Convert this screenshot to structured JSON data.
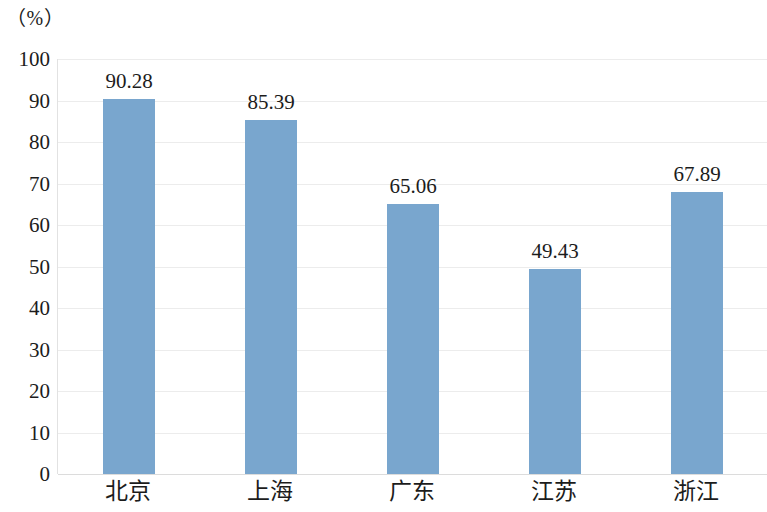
{
  "chart_data": {
    "type": "bar",
    "title": "",
    "subtitle": "",
    "xlabel": "",
    "ylabel": "（%）",
    "unit_label": "（%）",
    "categories": [
      "北京",
      "上海",
      "广东",
      "江苏",
      "浙江"
    ],
    "values": [
      90.28,
      85.39,
      65.06,
      49.43,
      67.89
    ],
    "value_labels": [
      "90.28",
      "85.39",
      "65.06",
      "49.43",
      "67.89"
    ],
    "series": [
      {
        "name": "",
        "values": [
          90.28,
          85.39,
          65.06,
          49.43,
          67.89
        ],
        "color": "#79a6ce"
      }
    ],
    "ylim": [
      0,
      100
    ],
    "ytick_values": [
      0,
      10,
      20,
      30,
      40,
      50,
      60,
      70,
      80,
      90,
      100
    ],
    "ytick_labels": [
      "0",
      "10",
      "20",
      "30",
      "40",
      "50",
      "60",
      "70",
      "80",
      "90",
      "100"
    ],
    "grid": true,
    "grid_axis": "y",
    "legend": false,
    "legend_position": "none",
    "bar_color": "#79a6ce",
    "gridline_color": "#ececec",
    "background_color": "#ffffff",
    "text_color": "#1c1c1c"
  }
}
